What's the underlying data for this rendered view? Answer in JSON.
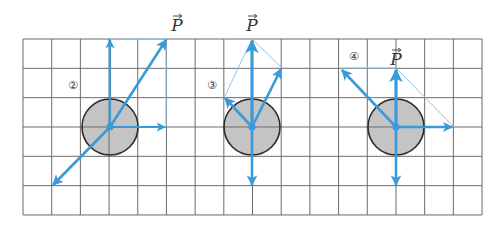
{
  "grid": {
    "x0": 23,
    "y0": 39,
    "cols": 16,
    "rows": 6,
    "cell_w": 28.69,
    "cell_h": 29.33,
    "line_color": "#6b6b6b"
  },
  "colors": {
    "arrow": "#3a9ad9",
    "thin_line": "#8cc4ea",
    "circle_fill": "#c4c4c4",
    "circle_stroke": "#2a2a2a"
  },
  "vector_label": "P",
  "diagrams": [
    {
      "id": "2",
      "number_label": "②",
      "number_pos": [
        73,
        84
      ],
      "center": [
        110,
        127
      ],
      "radius": 28,
      "p_label_pos": [
        177,
        25
      ],
      "arrows": [
        {
          "to": [
            110,
            40
          ],
          "width": 2.2
        },
        {
          "to": [
            165,
            127
          ],
          "width": 2.2
        },
        {
          "to": [
            166,
            40
          ],
          "width": 2.6
        },
        {
          "to": [
            53,
            185
          ],
          "width": 2.6
        }
      ],
      "thin_lines": [
        [
          [
            110,
            39
          ],
          [
            166,
            39
          ]
        ],
        [
          [
            166,
            39
          ],
          [
            166,
            127
          ]
        ]
      ]
    },
    {
      "id": "3",
      "number_label": "③",
      "number_pos": [
        212,
        84
      ],
      "center": [
        252,
        127
      ],
      "radius": 28,
      "p_label_pos": [
        252,
        25
      ],
      "arrows": [
        {
          "to": [
            252,
            41
          ],
          "width": 3.2
        },
        {
          "to": [
            225,
            98
          ],
          "width": 2.6
        },
        {
          "to": [
            281,
            69
          ],
          "width": 2.6
        },
        {
          "to": [
            252,
            185
          ],
          "width": 2.6
        }
      ],
      "thin_lines": [
        [
          [
            224,
            98
          ],
          [
            252,
            39
          ]
        ],
        [
          [
            282,
            68
          ],
          [
            252,
            39
          ]
        ]
      ]
    },
    {
      "id": "4",
      "number_label": "④",
      "number_pos": [
        354,
        55
      ],
      "center": [
        396,
        127
      ],
      "radius": 28,
      "p_label_pos": [
        396,
        59
      ],
      "arrows": [
        {
          "to": [
            396,
            70
          ],
          "width": 3.2
        },
        {
          "to": [
            342,
            70
          ],
          "width": 2.6
        },
        {
          "to": [
            452,
            127
          ],
          "width": 2.4
        },
        {
          "to": [
            396,
            185
          ],
          "width": 2.6
        }
      ],
      "thin_lines": [
        [
          [
            340,
            68
          ],
          [
            396,
            68
          ]
        ],
        [
          [
            396,
            68
          ],
          [
            454,
            127
          ]
        ]
      ]
    }
  ]
}
